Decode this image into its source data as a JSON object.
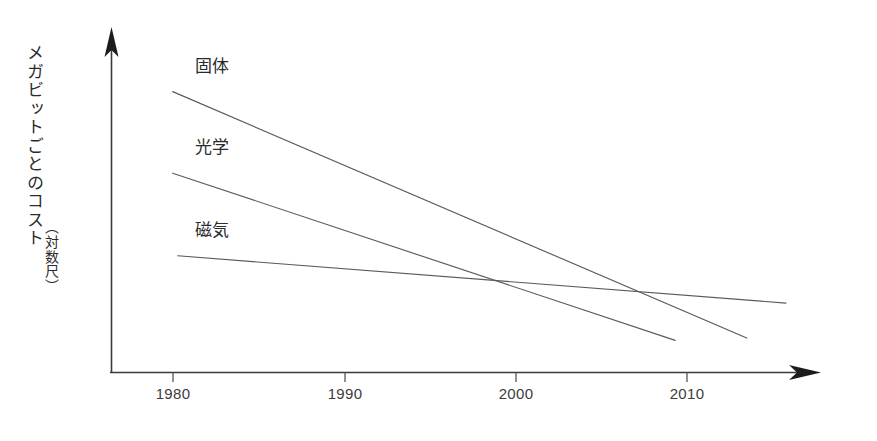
{
  "chart_data": {
    "type": "line",
    "title": "",
    "xlabel": "",
    "ylabel": "メガビットごとのコスト",
    "ylabel_note": "（対数尺）",
    "xticks": [
      "1980",
      "1990",
      "2000",
      "2010"
    ],
    "xtick_values": [
      1980,
      1990,
      2000,
      2010
    ],
    "xlim": [
      1977,
      2018
    ],
    "ylim": [
      0,
      10
    ],
    "y_scale": "log",
    "y_axis_ticks_shown": false,
    "grid": false,
    "legend_position": "inline-left-of-each-line",
    "axis_style": "arrow-ended",
    "series": [
      {
        "name": "固体",
        "label": "固体",
        "x": [
          1980,
          2013.7
        ],
        "y": [
          8.45,
          1.05
        ],
        "label_x": 1981.3,
        "label_y": 9.05
      },
      {
        "name": "光学",
        "label": "光学",
        "x": [
          1980,
          2009.5
        ],
        "y": [
          6.0,
          0.98
        ],
        "label_x": 1981.3,
        "label_y": 6.6
      },
      {
        "name": "磁気",
        "label": "磁気",
        "x": [
          1980.3,
          2016.0
        ],
        "y": [
          3.52,
          2.1
        ],
        "label_x": 1981.3,
        "label_y": 4.1
      }
    ]
  },
  "colors": {
    "background": "#ffffff",
    "axis": "#3b3b3b",
    "series_line": "#5a5a5a",
    "tick_label": "#3c3c3c",
    "series_label": "#2b2b2b"
  }
}
